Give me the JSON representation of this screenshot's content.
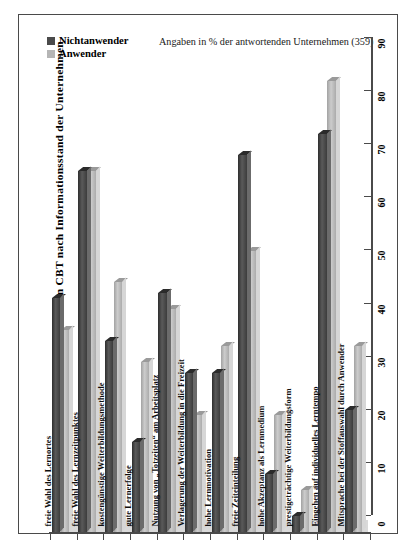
{
  "chart_data": {
    "type": "bar",
    "title": "Vorteile von CBT nach Informationsstand der Unternehmen",
    "subtitle": "Angaben in % der antwortenden Unternehmen (359)",
    "orientation": "vertical",
    "grid": false,
    "legend_position": "top-left",
    "xlabel": "",
    "ylabel": "Vorteile von CBT nach Informationsstand der Unternehmen",
    "ylim": [
      0,
      90
    ],
    "yticks": [
      "0",
      "10",
      "20",
      "30",
      "40",
      "50",
      "60",
      "70",
      "80",
      "90"
    ],
    "categories": [
      "freie Wahl des Lernortes",
      "freie Wahl des Lernzeitpunktes",
      "kostengünstige Weiterbildungsmethode",
      "gute Lernerfolge",
      "Nutzung von „Totzeiten“ am Arbeitsplatz",
      "Verlagerung der Weiterbildung in die Freizeit",
      "hohe Lernmotivation",
      "freie Zeiteinteilung",
      "hohe Akzeptanz als Lernmedium",
      "prestigeträchtige Weiterbildungsform",
      "Eingehen auf individuelles Lerntempo",
      "Mitsprache bei der Stoffauswahl durch Anwender"
    ],
    "series": [
      {
        "name": "Nichtanwender",
        "color": "#4a4a4a",
        "values": [
          44,
          68,
          36,
          17,
          45,
          30,
          30,
          71,
          11,
          3,
          75,
          23
        ]
      },
      {
        "name": "Anwender",
        "color": "#b5b5b5",
        "values": [
          38,
          68,
          47,
          32,
          42,
          22,
          35,
          53,
          22,
          8,
          85,
          35
        ]
      }
    ]
  },
  "legend": {
    "items": [
      {
        "label": "Nichtanwender",
        "color": "#4a4a4a"
      },
      {
        "label": "Anwender",
        "color": "#b5b5b5"
      }
    ]
  }
}
